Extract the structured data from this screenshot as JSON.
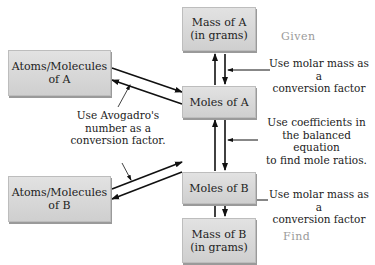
{
  "nodes": {
    "mass_a": {
      "line1": "Mass of A",
      "line2": "(in grams)"
    },
    "moles_a": {
      "text": "Moles of A"
    },
    "moles_b": {
      "text": "Moles of B"
    },
    "mass_b": {
      "line1": "Mass of B",
      "line2": "(in grams)"
    },
    "atoms_a": {
      "line1": "Atoms/Molecules",
      "line2": "of A"
    },
    "atoms_b": {
      "line1": "Atoms/Molecules",
      "line2": "of B"
    }
  },
  "tags": {
    "given": "Given",
    "find": "Find"
  },
  "annotations": {
    "molar_mass_top": {
      "line1": "Use molar mass as a",
      "line2": "conversion factor"
    },
    "coefficients": {
      "line1": "Use coefficients in",
      "line2": "the balanced equation",
      "line3": "to find mole ratios."
    },
    "molar_mass_bottom": {
      "line1": "Use molar mass as a",
      "line2": "conversion factor"
    },
    "avogadro": {
      "line1": "Use Avogadro's",
      "line2": "number as a",
      "line3": "conversion factor."
    }
  },
  "colors": {
    "box_fill": "#d8d8d8",
    "arrow": "#111111",
    "tag_text": "#9a9a9a"
  }
}
